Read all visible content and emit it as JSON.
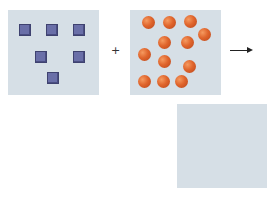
{
  "diagram": {
    "colors": {
      "box_bg": "#d6dfe6",
      "square": "#6a6fa8",
      "ball": "#e0652c",
      "arrow": "#222222"
    },
    "operator_plus": "+",
    "reactant_a": {
      "box": {
        "x": 8,
        "y": 10,
        "w": 91,
        "h": 85
      },
      "shape": "square",
      "count": 6,
      "items": [
        {
          "x": 19,
          "y": 24
        },
        {
          "x": 46,
          "y": 24
        },
        {
          "x": 73,
          "y": 24
        },
        {
          "x": 35,
          "y": 51
        },
        {
          "x": 73,
          "y": 51
        },
        {
          "x": 47,
          "y": 72
        }
      ]
    },
    "reactant_b": {
      "box": {
        "x": 130,
        "y": 10,
        "w": 91,
        "h": 85
      },
      "shape": "sphere",
      "count": 12,
      "items": [
        {
          "x": 148,
          "y": 22
        },
        {
          "x": 169,
          "y": 22
        },
        {
          "x": 190,
          "y": 21
        },
        {
          "x": 204,
          "y": 34
        },
        {
          "x": 164,
          "y": 42
        },
        {
          "x": 187,
          "y": 42
        },
        {
          "x": 144,
          "y": 54
        },
        {
          "x": 164,
          "y": 61
        },
        {
          "x": 189,
          "y": 66
        },
        {
          "x": 144,
          "y": 81
        },
        {
          "x": 163,
          "y": 81
        },
        {
          "x": 181,
          "y": 81
        }
      ]
    },
    "product": {
      "box": {
        "x": 177,
        "y": 104,
        "w": 90,
        "h": 84
      },
      "count": 0,
      "items": []
    },
    "plus_pos": {
      "x": 111,
      "y": 45
    },
    "arrow_pos": {
      "x": 230,
      "y": 50,
      "w": 19
    }
  }
}
